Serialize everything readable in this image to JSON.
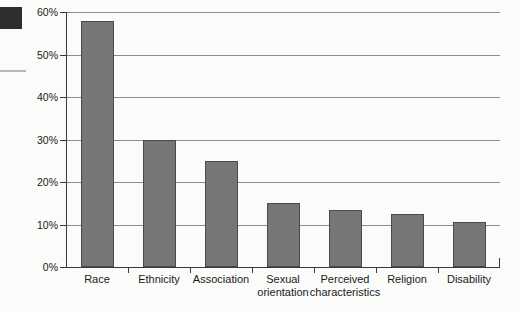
{
  "chart_data": {
    "type": "bar",
    "title": "",
    "xlabel": "",
    "ylabel": "",
    "categories": [
      "Race",
      "Ethnicity",
      "Association",
      "Sexual orientation",
      "Perceived characteristics",
      "Religion",
      "Disability"
    ],
    "category_lines": [
      [
        "Race",
        ""
      ],
      [
        "Ethnicity",
        ""
      ],
      [
        "Association",
        ""
      ],
      [
        "Sexual",
        "orientation"
      ],
      [
        "Perceived",
        "characteristics"
      ],
      [
        "Religion",
        ""
      ],
      [
        "Disability",
        ""
      ]
    ],
    "values": [
      58,
      30,
      25,
      15,
      13.5,
      12.5,
      10.5
    ],
    "value_labels": [
      "58%",
      "30%",
      "25%",
      "15%",
      "13.5%",
      "12.5%",
      "10.5%"
    ],
    "ylim": [
      0,
      60
    ],
    "yticks": [
      0,
      10,
      20,
      30,
      40,
      50,
      60
    ],
    "ytick_labels": [
      "0%",
      "10%",
      "20%",
      "30%",
      "40%",
      "50%",
      "60%"
    ],
    "grid": true,
    "legend": "none",
    "series_color": "#767676"
  }
}
